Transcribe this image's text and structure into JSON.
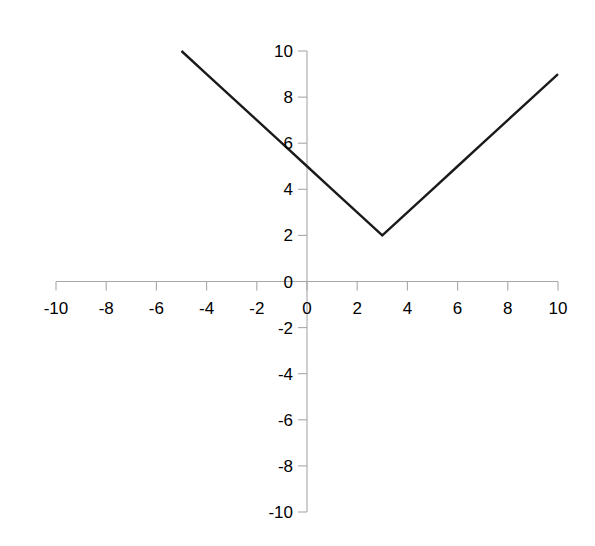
{
  "chart_data": {
    "type": "line",
    "title": "",
    "subtitle": "",
    "xlabel": "",
    "ylabel": "",
    "xlim": [
      -10,
      10
    ],
    "ylim": [
      -10,
      10
    ],
    "grid": false,
    "legend": null,
    "legend_position": "none",
    "equation": "y = |x - 3| + 2",
    "x_ticks": [
      -10,
      -8,
      -6,
      -4,
      -2,
      0,
      2,
      4,
      6,
      8,
      10
    ],
    "x_tick_labels": [
      "-10",
      "-8",
      "-6",
      "-4",
      "-2",
      "0",
      "2",
      "4",
      "6",
      "8",
      "10"
    ],
    "y_ticks": [
      10,
      8,
      6,
      4,
      2,
      0,
      -2,
      -4,
      -6,
      -8,
      -10
    ],
    "y_tick_labels": [
      "10",
      "8",
      "6",
      "4",
      "2",
      "0",
      "-2",
      "-4",
      "-6",
      "-8",
      "-10"
    ],
    "series": [
      {
        "name": "y = |x - 3| + 2",
        "color": "#1a1a1a",
        "line_width": 2.4,
        "x": [
          -5,
          -4,
          -3,
          -2,
          -1,
          0,
          1,
          2,
          3,
          4,
          5,
          6,
          7,
          8,
          9,
          10
        ],
        "values": [
          10,
          9,
          8,
          7,
          6,
          5,
          4,
          3,
          2,
          3,
          4,
          5,
          6,
          7,
          8,
          9
        ]
      }
    ],
    "vertex": {
      "x": 3,
      "y": 2
    },
    "axis_color": "#a8a8a8",
    "text_color": "#000000",
    "background_color": "#ffffff"
  },
  "axes": {
    "x_axis_name": "horizontal-axis",
    "y_axis_name": "vertical-axis",
    "origin_label": "0"
  }
}
